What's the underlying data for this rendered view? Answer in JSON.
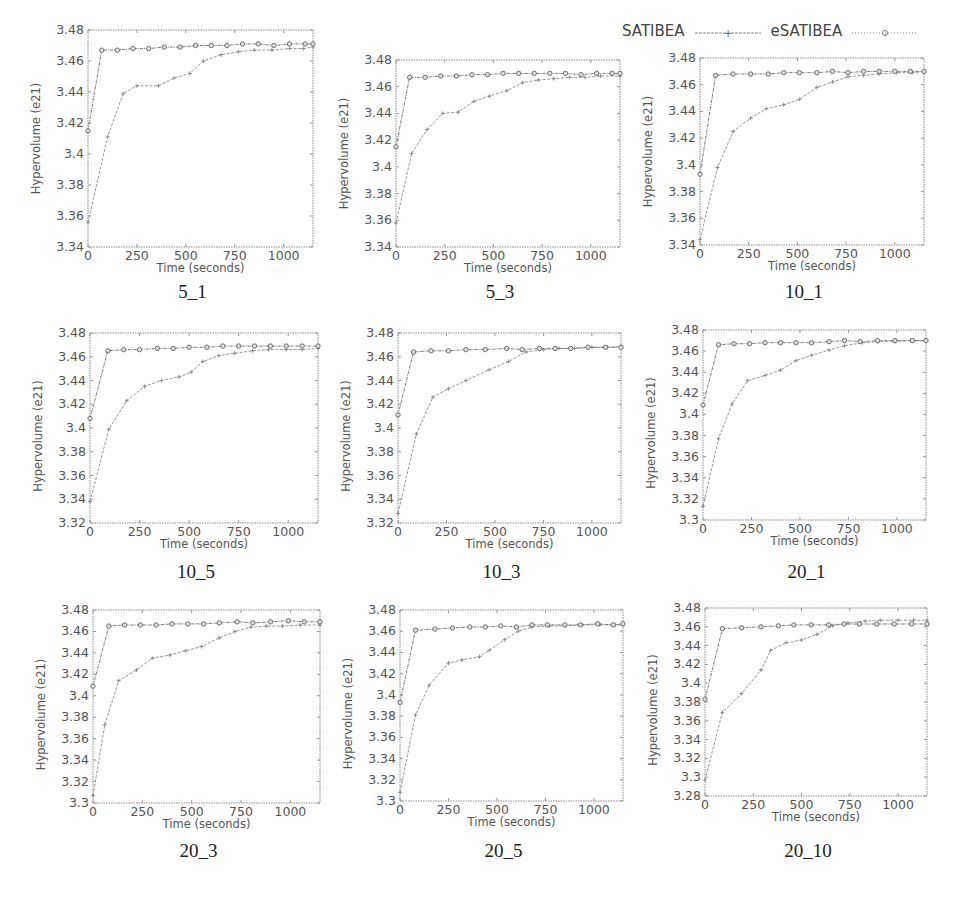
{
  "legend": {
    "satibea_label": "SATIBEA",
    "esatibea_label": "eSATIBEA"
  },
  "chart_data": [
    {
      "type": "line",
      "title": "5_1",
      "xlabel": "Time (seconds)",
      "ylabel": "Hypervolume (e21)",
      "xlim": [
        0,
        1150
      ],
      "ylim": [
        3.34,
        3.48
      ],
      "xticks": [
        0,
        250,
        500,
        750,
        1000
      ],
      "yticks": [
        3.34,
        3.36,
        3.38,
        3.4,
        3.42,
        3.44,
        3.46,
        3.48
      ],
      "grid": false,
      "legend": "top-right",
      "series": [
        {
          "name": "SATIBEA",
          "x": [
            0,
            100,
            180,
            250,
            360,
            440,
            520,
            590,
            680,
            770,
            850,
            940,
            1030,
            1100,
            1150
          ],
          "y": [
            3.356,
            3.411,
            3.439,
            3.444,
            3.444,
            3.449,
            3.452,
            3.46,
            3.464,
            3.466,
            3.467,
            3.467,
            3.468,
            3.468,
            3.469
          ]
        },
        {
          "name": "eSATIBEA",
          "x": [
            0,
            70,
            150,
            230,
            310,
            390,
            470,
            550,
            630,
            710,
            790,
            870,
            950,
            1030,
            1110,
            1150
          ],
          "y": [
            3.415,
            3.467,
            3.467,
            3.468,
            3.468,
            3.469,
            3.469,
            3.47,
            3.47,
            3.47,
            3.471,
            3.471,
            3.47,
            3.471,
            3.471,
            3.471
          ]
        }
      ]
    },
    {
      "type": "line",
      "title": "5_3",
      "xlabel": "Time (seconds)",
      "ylabel": "Hypervolume (e21)",
      "xlim": [
        0,
        1150
      ],
      "ylim": [
        3.34,
        3.48
      ],
      "xticks": [
        0,
        250,
        500,
        750,
        1000
      ],
      "yticks": [
        3.34,
        3.36,
        3.38,
        3.4,
        3.42,
        3.44,
        3.46,
        3.48
      ],
      "grid": false,
      "legend": "top-right",
      "series": [
        {
          "name": "SATIBEA",
          "x": [
            0,
            80,
            160,
            240,
            320,
            400,
            480,
            570,
            650,
            730,
            810,
            890,
            970,
            1050,
            1150
          ],
          "y": [
            3.358,
            3.41,
            3.428,
            3.44,
            3.441,
            3.449,
            3.453,
            3.457,
            3.463,
            3.465,
            3.466,
            3.467,
            3.467,
            3.468,
            3.468
          ]
        },
        {
          "name": "eSATIBEA",
          "x": [
            0,
            70,
            150,
            230,
            310,
            390,
            470,
            550,
            630,
            710,
            790,
            870,
            950,
            1030,
            1110,
            1150
          ],
          "y": [
            3.415,
            3.467,
            3.467,
            3.468,
            3.468,
            3.469,
            3.469,
            3.47,
            3.47,
            3.47,
            3.47,
            3.47,
            3.469,
            3.47,
            3.47,
            3.47
          ]
        }
      ]
    },
    {
      "type": "line",
      "title": "10_1",
      "xlabel": "Time (seconds)",
      "ylabel": "Hypervolume (e21)",
      "xlim": [
        0,
        1150
      ],
      "ylim": [
        3.34,
        3.48
      ],
      "xticks": [
        0,
        250,
        500,
        750,
        1000
      ],
      "yticks": [
        3.34,
        3.36,
        3.38,
        3.4,
        3.42,
        3.44,
        3.46,
        3.48
      ],
      "grid": false,
      "legend": "top-right",
      "series": [
        {
          "name": "SATIBEA",
          "x": [
            0,
            90,
            170,
            260,
            340,
            430,
            510,
            600,
            680,
            760,
            840,
            920,
            1010,
            1090,
            1150
          ],
          "y": [
            3.344,
            3.398,
            3.425,
            3.435,
            3.442,
            3.445,
            3.449,
            3.458,
            3.462,
            3.466,
            3.467,
            3.468,
            3.469,
            3.469,
            3.47
          ]
        },
        {
          "name": "eSATIBEA",
          "x": [
            0,
            80,
            170,
            260,
            350,
            430,
            510,
            600,
            680,
            760,
            840,
            920,
            1000,
            1080,
            1150
          ],
          "y": [
            3.393,
            3.467,
            3.468,
            3.468,
            3.468,
            3.469,
            3.469,
            3.469,
            3.47,
            3.469,
            3.47,
            3.47,
            3.47,
            3.47,
            3.47
          ]
        }
      ]
    },
    {
      "type": "line",
      "title": "10_5",
      "xlabel": "Time (seconds)",
      "ylabel": "Hypervolume (e21)",
      "xlim": [
        0,
        1150
      ],
      "ylim": [
        3.32,
        3.48
      ],
      "xticks": [
        0,
        250,
        500,
        750,
        1000
      ],
      "yticks": [
        3.32,
        3.34,
        3.36,
        3.38,
        3.4,
        3.42,
        3.44,
        3.46,
        3.48
      ],
      "grid": false,
      "legend": "top-right",
      "series": [
        {
          "name": "SATIBEA",
          "x": [
            0,
            95,
            185,
            275,
            360,
            450,
            510,
            570,
            650,
            730,
            820,
            900,
            990,
            1070,
            1150
          ],
          "y": [
            3.338,
            3.399,
            3.423,
            3.435,
            3.44,
            3.443,
            3.447,
            3.456,
            3.461,
            3.463,
            3.465,
            3.466,
            3.466,
            3.466,
            3.467
          ]
        },
        {
          "name": "eSATIBEA",
          "x": [
            0,
            90,
            170,
            250,
            340,
            420,
            500,
            590,
            670,
            750,
            830,
            910,
            990,
            1070,
            1150
          ],
          "y": [
            3.408,
            3.465,
            3.466,
            3.466,
            3.467,
            3.467,
            3.468,
            3.468,
            3.469,
            3.469,
            3.469,
            3.469,
            3.469,
            3.469,
            3.469
          ]
        }
      ]
    },
    {
      "type": "line",
      "title": "10_3",
      "xlabel": "Time (seconds)",
      "ylabel": "Hypervolume (e21)",
      "xlim": [
        0,
        1150
      ],
      "ylim": [
        3.32,
        3.48
      ],
      "xticks": [
        0,
        250,
        500,
        750,
        1000
      ],
      "yticks": [
        3.32,
        3.34,
        3.36,
        3.38,
        3.4,
        3.42,
        3.44,
        3.46,
        3.48
      ],
      "grid": false,
      "legend": "top-right",
      "series": [
        {
          "name": "SATIBEA",
          "x": [
            0,
            95,
            180,
            260,
            350,
            470,
            570,
            660,
            750,
            830,
            910,
            1000,
            1080,
            1150
          ],
          "y": [
            3.328,
            3.395,
            3.426,
            3.433,
            3.44,
            3.449,
            3.456,
            3.464,
            3.466,
            3.467,
            3.467,
            3.468,
            3.468,
            3.469
          ]
        },
        {
          "name": "eSATIBEA",
          "x": [
            0,
            80,
            170,
            260,
            350,
            450,
            560,
            640,
            730,
            810,
            890,
            980,
            1070,
            1150
          ],
          "y": [
            3.411,
            3.464,
            3.465,
            3.465,
            3.466,
            3.466,
            3.467,
            3.466,
            3.467,
            3.467,
            3.467,
            3.468,
            3.468,
            3.468
          ]
        }
      ]
    },
    {
      "type": "line",
      "title": "20_1",
      "xlabel": "Time (seconds)",
      "ylabel": "Hypervolume (e21)",
      "xlim": [
        0,
        1150
      ],
      "ylim": [
        3.3,
        3.48
      ],
      "xticks": [
        0,
        250,
        500,
        750,
        1000
      ],
      "yticks": [
        3.3,
        3.32,
        3.34,
        3.36,
        3.38,
        3.4,
        3.42,
        3.44,
        3.46,
        3.48
      ],
      "grid": false,
      "legend": "top-right",
      "series": [
        {
          "name": "SATIBEA",
          "x": [
            0,
            80,
            150,
            230,
            320,
            400,
            480,
            560,
            650,
            730,
            820,
            900,
            990,
            1070,
            1150
          ],
          "y": [
            3.313,
            3.377,
            3.41,
            3.432,
            3.437,
            3.442,
            3.451,
            3.456,
            3.461,
            3.465,
            3.468,
            3.469,
            3.469,
            3.47,
            3.47
          ]
        },
        {
          "name": "eSATIBEA",
          "x": [
            0,
            80,
            160,
            240,
            320,
            400,
            480,
            560,
            650,
            730,
            810,
            900,
            990,
            1080,
            1150
          ],
          "y": [
            3.409,
            3.466,
            3.467,
            3.467,
            3.468,
            3.468,
            3.468,
            3.468,
            3.469,
            3.47,
            3.469,
            3.47,
            3.47,
            3.47,
            3.47
          ]
        }
      ]
    },
    {
      "type": "line",
      "title": "20_3",
      "xlabel": "Time (seconds)",
      "ylabel": "Hypervolume (e21)",
      "xlim": [
        0,
        1150
      ],
      "ylim": [
        3.3,
        3.48
      ],
      "xticks": [
        0,
        250,
        500,
        750,
        1000
      ],
      "yticks": [
        3.3,
        3.32,
        3.34,
        3.36,
        3.38,
        3.4,
        3.42,
        3.44,
        3.46,
        3.48
      ],
      "grid": false,
      "legend": "top-right",
      "series": [
        {
          "name": "SATIBEA",
          "x": [
            0,
            60,
            130,
            220,
            300,
            390,
            470,
            550,
            640,
            720,
            800,
            880,
            960,
            1050,
            1150
          ],
          "y": [
            3.307,
            3.373,
            3.414,
            3.424,
            3.435,
            3.438,
            3.442,
            3.446,
            3.454,
            3.46,
            3.464,
            3.465,
            3.465,
            3.466,
            3.466
          ]
        },
        {
          "name": "eSATIBEA",
          "x": [
            0,
            80,
            160,
            240,
            320,
            400,
            480,
            560,
            640,
            730,
            810,
            900,
            990,
            1070,
            1150
          ],
          "y": [
            3.409,
            3.465,
            3.466,
            3.466,
            3.466,
            3.467,
            3.467,
            3.467,
            3.468,
            3.469,
            3.468,
            3.469,
            3.47,
            3.469,
            3.469
          ]
        }
      ]
    },
    {
      "type": "line",
      "title": "20_5",
      "xlabel": "Time (seconds)",
      "ylabel": "Hypervolume (e21)",
      "xlim": [
        0,
        1150
      ],
      "ylim": [
        3.3,
        3.48
      ],
      "xticks": [
        0,
        250,
        500,
        750,
        1000
      ],
      "yticks": [
        3.3,
        3.32,
        3.34,
        3.36,
        3.38,
        3.4,
        3.42,
        3.44,
        3.46,
        3.48
      ],
      "grid": false,
      "legend": "top-right",
      "series": [
        {
          "name": "SATIBEA",
          "x": [
            0,
            80,
            150,
            250,
            320,
            410,
            460,
            540,
            610,
            680,
            770,
            850,
            940,
            1030,
            1110,
            1150
          ],
          "y": [
            3.308,
            3.381,
            3.409,
            3.43,
            3.433,
            3.436,
            3.442,
            3.452,
            3.46,
            3.464,
            3.465,
            3.465,
            3.466,
            3.466,
            3.466,
            3.466
          ]
        },
        {
          "name": "eSATIBEA",
          "x": [
            0,
            80,
            180,
            270,
            360,
            440,
            520,
            600,
            680,
            760,
            850,
            930,
            1020,
            1100,
            1150
          ],
          "y": [
            3.393,
            3.461,
            3.462,
            3.463,
            3.464,
            3.464,
            3.465,
            3.464,
            3.466,
            3.466,
            3.466,
            3.466,
            3.467,
            3.466,
            3.467
          ]
        }
      ]
    },
    {
      "type": "line",
      "title": "20_10",
      "xlabel": "Time (seconds)",
      "ylabel": "Hypervolume (e21)",
      "xlim": [
        0,
        1150
      ],
      "ylim": [
        3.28,
        3.48
      ],
      "xticks": [
        0,
        250,
        500,
        750,
        1000
      ],
      "yticks": [
        3.28,
        3.3,
        3.32,
        3.34,
        3.36,
        3.38,
        3.4,
        3.42,
        3.44,
        3.46,
        3.48
      ],
      "grid": false,
      "legend": "top-right",
      "series": [
        {
          "name": "SATIBEA",
          "x": [
            0,
            90,
            190,
            290,
            340,
            420,
            500,
            580,
            660,
            740,
            830,
            910,
            1000,
            1080,
            1150
          ],
          "y": [
            3.297,
            3.369,
            3.389,
            3.414,
            3.435,
            3.443,
            3.446,
            3.452,
            3.461,
            3.464,
            3.466,
            3.467,
            3.467,
            3.467,
            3.467
          ]
        },
        {
          "name": "eSATIBEA",
          "x": [
            0,
            90,
            190,
            290,
            380,
            460,
            550,
            640,
            720,
            800,
            890,
            980,
            1070,
            1150
          ],
          "y": [
            3.383,
            3.458,
            3.459,
            3.46,
            3.461,
            3.462,
            3.462,
            3.462,
            3.463,
            3.463,
            3.463,
            3.463,
            3.463,
            3.463
          ]
        }
      ]
    }
  ]
}
